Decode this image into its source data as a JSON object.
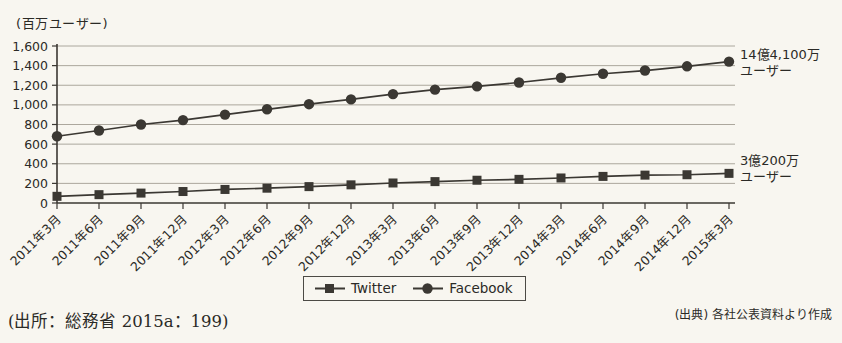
{
  "figure": {
    "source_left": "(出所：総務省 2015a：199)",
    "source_right": "(出典) 各社公表資料より作成"
  },
  "colors": {
    "ink": "#3b3833",
    "grid": "#a39e93",
    "paper": "#f8f6f0"
  },
  "chart_data": {
    "type": "line",
    "title": "",
    "ylabel": "(百万ユーザー)",
    "xlabel": "",
    "ylim": [
      0,
      1600
    ],
    "ytick_step": 200,
    "grid": true,
    "legend_position": "bottom",
    "categories": [
      "2011年3月",
      "2011年6月",
      "2011年9月",
      "2011年12月",
      "2012年3月",
      "2012年6月",
      "2012年9月",
      "2012年12月",
      "2013年3月",
      "2013年6月",
      "2013年9月",
      "2013年12月",
      "2014年3月",
      "2014年6月",
      "2014年9月",
      "2014年12月",
      "2015年3月"
    ],
    "series": [
      {
        "name": "Twitter",
        "marker": "square",
        "values": [
          68,
          85,
          101,
          117,
          138,
          151,
          167,
          185,
          204,
          218,
          232,
          241,
          255,
          271,
          284,
          288,
          302
        ]
      },
      {
        "name": "Facebook",
        "marker": "circle",
        "values": [
          680,
          739,
          800,
          845,
          901,
          955,
          1007,
          1056,
          1110,
          1155,
          1189,
          1228,
          1276,
          1317,
          1350,
          1393,
          1441
        ]
      }
    ],
    "annotations": {
      "facebook": {
        "line1": "14億4,100万",
        "line2": "ユーザー"
      },
      "twitter": {
        "line1": "3億200万",
        "line2": "ユーザー"
      }
    }
  }
}
